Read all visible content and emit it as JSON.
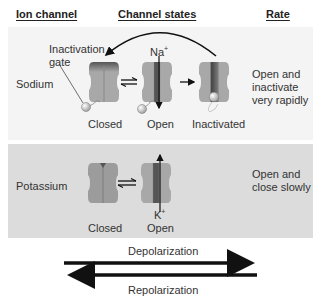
{
  "headers": {
    "ion_channel": "Ion channel",
    "channel_states": "Channel states",
    "rate": "Rate"
  },
  "sodium": {
    "name": "Sodium",
    "ion_label": "Na",
    "ion_charge": "+",
    "gate_label_line1": "Inactivation",
    "gate_label_line2": "gate",
    "states": [
      "Closed",
      "Open",
      "Inactivated"
    ],
    "rate_line1": "Open and",
    "rate_line2": "inactivate",
    "rate_line3": "very rapidly"
  },
  "potassium": {
    "name": "Potassium",
    "ion_label": "K",
    "ion_charge": "+",
    "states": [
      "Closed",
      "Open"
    ],
    "rate_line1": "Open and",
    "rate_line2": "close slowly"
  },
  "arrows": {
    "forward": "Depolarization",
    "reverse": "Repolarization"
  },
  "colors": {
    "channel_body": "#a8a8a8",
    "channel_dark": "#4a4a4a",
    "na_panel": "#f4f4f4",
    "k_panel": "#dcdcdc",
    "arrow": "#111111"
  }
}
